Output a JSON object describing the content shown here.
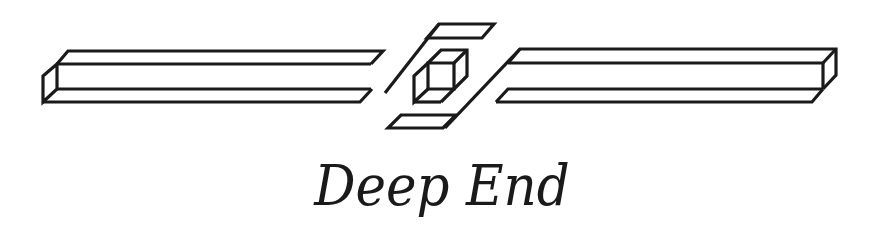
{
  "logo": {
    "title": "Deep End",
    "ink_color": "#1a1a1a",
    "background_color": "#ffffff",
    "elements": [
      "left-bar",
      "center-cube",
      "right-bar",
      "top-slab",
      "bottom-slab",
      "diagonal-slashes"
    ]
  }
}
